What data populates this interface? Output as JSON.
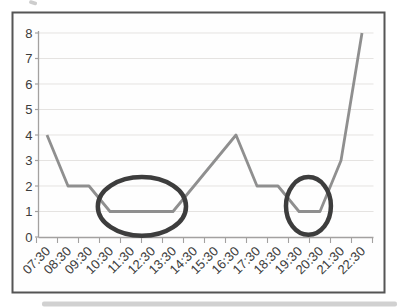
{
  "figure": {
    "background": "#ffffff",
    "frame_border_color": "#555555",
    "frame_fill": "#fefefe",
    "page_shadow_color": "#c9c9c9",
    "scan_artifact_color": "#b8b8b8"
  },
  "chart_data": {
    "type": "line",
    "title": "",
    "xlabel": "",
    "ylabel": "",
    "categories": [
      "07:30",
      "08:30",
      "09:30",
      "10:30",
      "11:30",
      "12:30",
      "13:30",
      "14:30",
      "15:30",
      "16:30",
      "17:30",
      "18:30",
      "19:30",
      "20:30",
      "21:30",
      "22:30"
    ],
    "series": [
      {
        "name": "values",
        "values": [
          4,
          2,
          2,
          1,
          1,
          1,
          1,
          2,
          3,
          4,
          2,
          2,
          1,
          1,
          3,
          8
        ],
        "color": "#8f8f8f",
        "stroke_width": 2.8
      }
    ],
    "ylim": [
      0,
      8
    ],
    "ytick_labels": [
      "0",
      "1",
      "2",
      "3",
      "4",
      "5",
      "6",
      "7",
      "8"
    ],
    "grid": "horizontal",
    "legend": "none",
    "gridline_color": "#e5e3e1",
    "axis_color": "#a3a1a0",
    "tick_label_color": "#3c3c3c",
    "tick_label_size": 13,
    "x_label_rotation_deg": -45,
    "annotations": [
      {
        "type": "ellipse",
        "name": "highlight-ellipse-1030-1330",
        "note": "circles flat low period value 1 from 10:30 to 13:30",
        "center_category_index": 4.52,
        "center_value": 1.2,
        "radius_categories": 2.1,
        "radius_values": 1.15,
        "color": "#3d3d3d",
        "stroke_width": 4.5
      },
      {
        "type": "ellipse",
        "name": "highlight-ellipse-1930-2030",
        "note": "circles flat low period value 1 from 19:30 to 20:30",
        "center_category_index": 12.45,
        "center_value": 1.22,
        "radius_categories": 1.07,
        "radius_values": 1.13,
        "color": "#3d3d3d",
        "stroke_width": 4.5
      }
    ]
  }
}
